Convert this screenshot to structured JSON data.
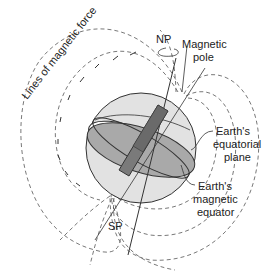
{
  "diagram": {
    "labels": {
      "lines_of_force": "Lines of magnetic force",
      "north_pole": "NP",
      "south_pole": "SP",
      "magnetic_pole_1": "Magnetic",
      "magnetic_pole_2": "pole",
      "equatorial_plane_1": "Earth's",
      "equatorial_plane_2": "equatorial",
      "equatorial_plane_3": "plane",
      "magnetic_equator_1": "Earth's",
      "magnetic_equator_2": "magnetic",
      "magnetic_equator_3": "equator"
    },
    "colors": {
      "globe_fill": "#e2e2e2",
      "plane_fill": "#a9a9a9",
      "magnet_fill": "#7a7a7a",
      "field_lines": "#555555",
      "outline": "#333333"
    }
  }
}
